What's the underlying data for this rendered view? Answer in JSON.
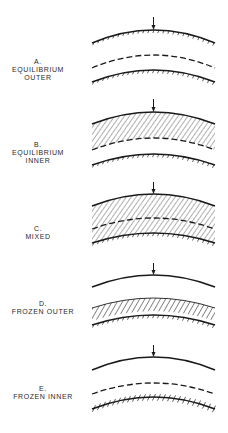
{
  "figure": {
    "ink_color": "#1a1a1a",
    "hatch_color": "#3a3a3a",
    "panels": [
      {
        "id": "A",
        "letter": "A.",
        "lines": [
          "EQUILIBRIUM",
          "OUTER"
        ],
        "label_center_x": 38,
        "label_top": 58,
        "outer_surface": {
          "y_end": 43,
          "y_peak": 30,
          "ticks": "below"
        },
        "arrow_top": 17,
        "hatched_region": "none",
        "dashed_front": {
          "y_end": 68,
          "y_peak": 55
        },
        "inner_surface": {
          "y_end": 82,
          "y_peak": 70,
          "ticks": "above"
        }
      },
      {
        "id": "B",
        "letter": "B.",
        "lines": [
          "EQUILIBRIUM",
          "INNER"
        ],
        "label_center_x": 38,
        "label_top": 141,
        "outer_surface": {
          "y_end": 124,
          "y_peak": 112,
          "ticks": "none"
        },
        "arrow_top": 99,
        "hatched_region": "outer-to-dashed",
        "dashed_front": {
          "y_end": 150,
          "y_peak": 138
        },
        "inner_surface": {
          "y_end": 165,
          "y_peak": 154,
          "ticks": "above"
        }
      },
      {
        "id": "C",
        "letter": "C.",
        "lines": [
          "MIXED"
        ],
        "label_center_x": 38,
        "label_top": 225,
        "outer_surface": {
          "y_end": 206,
          "y_peak": 194,
          "ticks": "none"
        },
        "arrow_top": 182,
        "hatched_region": "outer-to-inner",
        "dashed_front": {
          "y_end": 229,
          "y_peak": 218
        },
        "inner_surface": {
          "y_end": 243,
          "y_peak": 233,
          "ticks": "above"
        }
      },
      {
        "id": "D",
        "letter": "D.",
        "lines": [
          "FROZEN OUTER"
        ],
        "label_center_x": 43,
        "label_top": 300,
        "outer_surface": {
          "y_end": 287,
          "y_peak": 275,
          "ticks": "none"
        },
        "arrow_top": 263,
        "hatched_region": "band-above-inner",
        "band_top": {
          "y_end": 308,
          "y_peak": 298
        },
        "inner_surface": {
          "y_end": 325,
          "y_peak": 315,
          "ticks": "above"
        }
      },
      {
        "id": "E",
        "letter": "E.",
        "lines": [
          "FROZEN INNER"
        ],
        "label_center_x": 43,
        "label_top": 385,
        "outer_surface": {
          "y_end": 370,
          "y_peak": 357,
          "ticks": "none"
        },
        "arrow_top": 345,
        "hatched_region": "none",
        "dashed_front": {
          "y_end": 394,
          "y_peak": 383
        },
        "inner_surface": {
          "y_end": 409,
          "y_peak": 397,
          "ticks": "crossing"
        }
      }
    ]
  }
}
